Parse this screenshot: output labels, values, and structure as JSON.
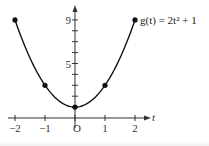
{
  "chart_data": {
    "type": "line",
    "title": "",
    "function_label": "g(t) = 2t² + 1",
    "xlabel": "t",
    "ylabel": "",
    "x_ticks": [
      -2,
      -1,
      0,
      1,
      2
    ],
    "x_tick_labels": [
      "−2",
      "−1",
      "O",
      "1",
      "2"
    ],
    "y_ticks": [
      1,
      2,
      3,
      4,
      5,
      6,
      7,
      8,
      9
    ],
    "y_tick_labels_shown": {
      "5": "5",
      "9": "9"
    },
    "xlim": [
      -2,
      2
    ],
    "ylim": [
      0,
      10
    ],
    "grid": false,
    "legend": "none",
    "series": [
      {
        "name": "g(t) = 2t² + 1",
        "curve": "parabola",
        "marked_points": [
          {
            "t": -2,
            "g": 9
          },
          {
            "t": -1,
            "g": 3
          },
          {
            "t": 0,
            "g": 1
          },
          {
            "t": 1,
            "g": 3
          },
          {
            "t": 2,
            "g": 9
          }
        ]
      }
    ]
  },
  "colors": {
    "curve": "#111111",
    "axis": "#333333",
    "background": "#ffffff"
  }
}
